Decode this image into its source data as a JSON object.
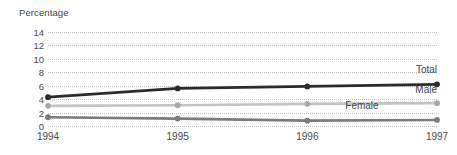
{
  "chart_data": {
    "type": "line",
    "title": "",
    "subtitle": "",
    "xlabel": "",
    "ylabel": "Percentage",
    "categories": [
      "1994",
      "1995",
      "1996",
      "1997"
    ],
    "x": [
      1994,
      1995,
      1996,
      1997
    ],
    "ylim": [
      0,
      14
    ],
    "yticks": [
      0,
      2,
      4,
      6,
      8,
      10,
      12,
      14
    ],
    "ytick_labels": [
      "0",
      "2",
      "4",
      "6",
      "8",
      "10",
      "12",
      "14"
    ],
    "grid": "horizontal-dotted",
    "legend_position": "inline-end-labels",
    "series": [
      {
        "name": "Total",
        "values": [
          4.3,
          5.6,
          5.9,
          6.2
        ],
        "color": "#2b2b2b",
        "label_anchor_x": 1997,
        "label_anchor_y": 7.6
      },
      {
        "name": "Male",
        "values": [
          3.0,
          3.1,
          3.3,
          3.4
        ],
        "color": "#c4c4c4",
        "label_anchor_x": 1997,
        "label_anchor_y": 4.6
      },
      {
        "name": "Female",
        "values": [
          1.3,
          1.1,
          0.8,
          0.9
        ],
        "color": "#7c7c7c",
        "label_anchor_x": 1996.55,
        "label_anchor_y": 2.3
      }
    ]
  },
  "axis": {
    "y_title": "Percentage"
  }
}
